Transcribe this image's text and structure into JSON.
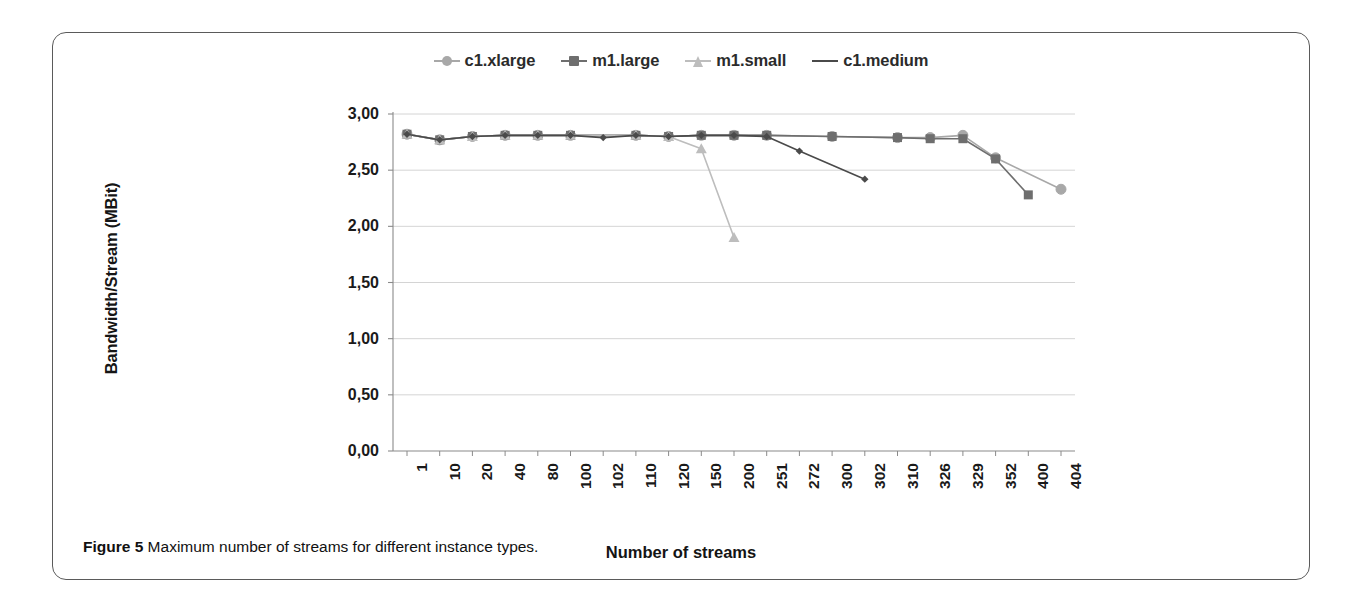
{
  "figure": {
    "caption_prefix": "Figure 5",
    "caption_text": "Maximum number of streams for different instance types."
  },
  "chart_data": {
    "type": "line",
    "title": "",
    "xlabel": "Number of streams",
    "ylabel": "Bandwidth/Stream (MBit)",
    "ylim": [
      0,
      3
    ],
    "ytick_labels": [
      "3,00",
      "2,50",
      "2,00",
      "1,50",
      "1,00",
      "0,50",
      "0,00"
    ],
    "ytick_values": [
      3.0,
      2.5,
      2.0,
      1.5,
      1.0,
      0.5,
      0.0
    ],
    "grid": true,
    "legend_position": "top-center",
    "decimal_separator": ",",
    "categories": [
      "1",
      "10",
      "20",
      "40",
      "80",
      "100",
      "102",
      "110",
      "120",
      "150",
      "200",
      "251",
      "272",
      "300",
      "302",
      "310",
      "326",
      "329",
      "352",
      "400",
      "404"
    ],
    "series": [
      {
        "name": "c1.xlarge",
        "marker": "circle",
        "color": "#a8a8a8",
        "values": [
          2.82,
          2.77,
          2.8,
          2.81,
          2.81,
          2.81,
          null,
          2.81,
          2.8,
          2.81,
          2.81,
          2.81,
          null,
          2.8,
          null,
          2.79,
          2.79,
          2.81,
          2.61,
          null,
          2.33
        ]
      },
      {
        "name": "m1.large",
        "marker": "square",
        "color": "#6e6e6e",
        "values": [
          2.82,
          2.77,
          2.8,
          2.81,
          2.81,
          2.81,
          null,
          2.81,
          2.8,
          2.81,
          2.81,
          2.81,
          null,
          2.8,
          null,
          2.79,
          2.78,
          2.78,
          2.6,
          2.28,
          null
        ]
      },
      {
        "name": "m1.small",
        "marker": "triangle",
        "color": "#bdbdbd",
        "values": [
          2.82,
          2.77,
          2.8,
          2.81,
          2.81,
          2.81,
          null,
          2.81,
          2.8,
          2.69,
          1.9,
          null,
          null,
          null,
          null,
          null,
          null,
          null,
          null,
          null,
          null
        ]
      },
      {
        "name": "c1.medium",
        "marker": "line",
        "color": "#4a4a4a",
        "values": [
          2.82,
          2.77,
          2.8,
          2.81,
          2.81,
          2.81,
          2.79,
          2.81,
          2.8,
          2.81,
          2.81,
          2.8,
          2.67,
          null,
          2.42,
          null,
          null,
          null,
          null,
          null,
          null
        ]
      }
    ]
  },
  "legend": {
    "items": [
      {
        "label": "c1.xlarge"
      },
      {
        "label": "m1.large"
      },
      {
        "label": "m1.small"
      },
      {
        "label": "c1.medium"
      }
    ]
  }
}
